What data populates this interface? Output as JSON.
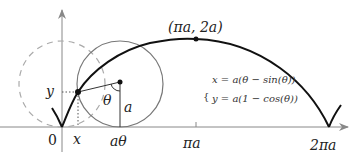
{
  "diagram": {
    "labels": {
      "origin": "0",
      "x": "x",
      "y": "y",
      "a_theta": "aθ",
      "pi_a": "πa",
      "two_pi_a": "2πa",
      "theta": "θ",
      "radius": "a",
      "apex": "(πa, 2a)"
    },
    "equations": {
      "x_eq": "x = a(θ − sin(θ))",
      "y_eq": "y = a(1 − cos(θ))"
    },
    "colors": {
      "curve": "#111111",
      "axis": "#888888",
      "circle": "#777777",
      "dashed_circle": "#aaaaaa",
      "text": "#222222"
    }
  }
}
